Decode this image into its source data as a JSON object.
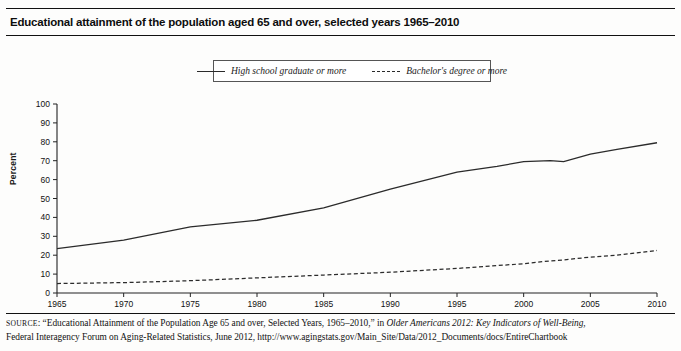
{
  "title": "Educational attainment of the population aged 65 and over, selected years 1965–2010",
  "legend": {
    "items": [
      {
        "label": "High school graduate or more",
        "style": "solid"
      },
      {
        "label": "Bachelor's degree or more",
        "style": "dashed"
      }
    ]
  },
  "axes": {
    "ylabel": "Percent",
    "yticks": [
      "0",
      "10",
      "20",
      "30",
      "40",
      "50",
      "60",
      "70",
      "80",
      "90",
      "100"
    ],
    "xticks": [
      "1965",
      "1970",
      "1975",
      "1980",
      "1985",
      "1990",
      "1995",
      "2000",
      "2005",
      "2010"
    ]
  },
  "source": {
    "prefix": "SOURCE",
    "line1_a": ": “Educational Attainment of the Population Age 65 and over, Selected Years, 1965–2010,” in ",
    "line1_italic": "Older Americans 2012: Key Indicators of Well-Being,",
    "line2": "Federal Interagency Forum on Aging-Related Statistics, June 2012, http://www.agingstats.gov/Main_Site/Data/2012_Documents/docs/EntireChartbook"
  },
  "chart_data": {
    "type": "line",
    "title": "Educational attainment of the population aged 65 and over, selected years 1965–2010",
    "xlabel": "",
    "ylabel": "Percent",
    "xlim": [
      1965,
      2010
    ],
    "ylim": [
      0,
      100
    ],
    "grid": false,
    "legend_position": "top",
    "x": [
      1965,
      1970,
      1975,
      1980,
      1985,
      1990,
      1995,
      1998,
      2000,
      2002,
      2003,
      2005,
      2007,
      2010
    ],
    "series": [
      {
        "name": "High school graduate or more",
        "style": "solid",
        "values": [
          23.5,
          28.0,
          35.0,
          38.5,
          45.0,
          55.0,
          64.0,
          67.0,
          69.5,
          70.0,
          69.5,
          73.5,
          76.0,
          79.5
        ]
      },
      {
        "name": "Bachelor's degree or more",
        "style": "dashed",
        "values": [
          5.0,
          5.5,
          6.5,
          8.0,
          9.5,
          11.0,
          13.0,
          14.5,
          15.5,
          17.0,
          17.5,
          19.0,
          20.0,
          22.5
        ]
      }
    ]
  }
}
